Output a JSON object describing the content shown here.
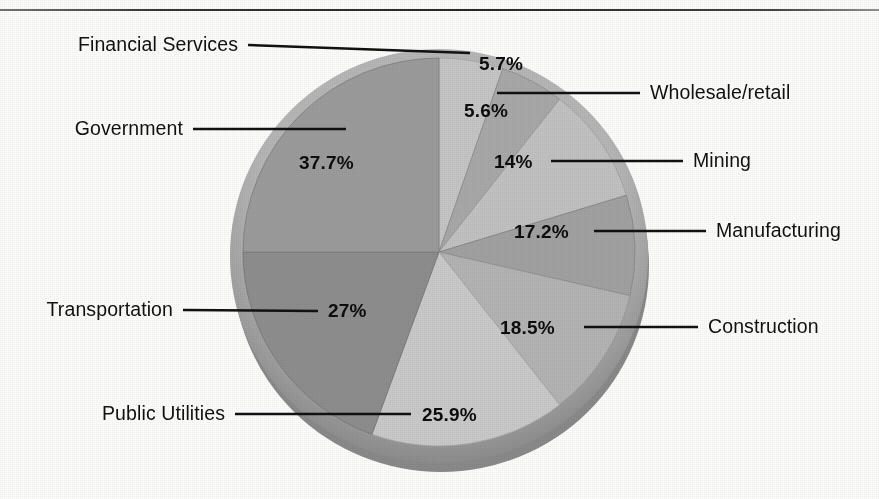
{
  "figure": {
    "type": "pie-chart-scan",
    "background_color": "#fdfdfc",
    "rule_color": "#232323"
  },
  "chart_data": {
    "type": "pie",
    "title": "",
    "subtitle": "",
    "xlabel": "",
    "ylabel": "",
    "legend_position": "callout-labels",
    "grid": false,
    "style": "3d-shaded-grayscale",
    "categories": [
      "Financial Services",
      "Wholesale/retail",
      "Mining",
      "Manufacturing",
      "Construction",
      "Public Utilities",
      "Transportation",
      "Government"
    ],
    "values": [
      5.7,
      5.6,
      14,
      17.2,
      18.5,
      25.9,
      27,
      37.7
    ],
    "value_labels": [
      "5.7%",
      "5.6%",
      "14%",
      "17.2%",
      "18.5%",
      "25.9%",
      "27%",
      "37.7%"
    ],
    "slices": [
      {
        "label": "Financial Services",
        "value_label": "5.7%",
        "value": 5.7,
        "color": "#c6c6c6",
        "side_color": "#a5a5a5",
        "start_angle": 0,
        "end_angle": 19,
        "label_side": "left"
      },
      {
        "label": "Wholesale/retail",
        "value_label": "5.6%",
        "value": 5.6,
        "color": "#a9a9a9",
        "side_color": "#8b8b8b",
        "start_angle": 19,
        "end_angle": 38,
        "label_side": "right"
      },
      {
        "label": "Mining",
        "value_label": "14%",
        "value": 14,
        "color": "#c2c2c2",
        "side_color": "#9e9e9e",
        "start_angle": 38,
        "end_angle": 73,
        "label_side": "right"
      },
      {
        "label": "Manufacturing",
        "value_label": "17.2%",
        "value": 17.2,
        "color": "#a2a2a2",
        "side_color": "#868686",
        "start_angle": 73,
        "end_angle": 103,
        "label_side": "right"
      },
      {
        "label": "Construction",
        "value_label": "18.5%",
        "value": 18.5,
        "color": "#b4b4b4",
        "side_color": "#949494",
        "start_angle": 103,
        "end_angle": 142,
        "label_side": "right"
      },
      {
        "label": "Public Utilities",
        "value_label": "25.9%",
        "value": 25.9,
        "color": "#cacaca",
        "side_color": "#a8a8a8",
        "start_angle": 142,
        "end_angle": 200,
        "label_side": "left"
      },
      {
        "label": "Transportation",
        "value_label": "27%",
        "value": 27,
        "color": "#8e8e8e",
        "side_color": "#767676",
        "start_angle": 200,
        "end_angle": 270,
        "label_side": "left"
      },
      {
        "label": "Government",
        "value_label": "37.7%",
        "value": 37.7,
        "color": "#9c9c9c",
        "side_color": "#7f7f7f",
        "start_angle": 270,
        "end_angle": 360,
        "label_side": "left"
      }
    ]
  },
  "callouts": {
    "financial_services": "Financial Services",
    "government": "Government",
    "transportation": "Transportation",
    "public_utilities": "Public Utilities",
    "wholesale_retail": "Wholesale/retail",
    "mining": "Mining",
    "manufacturing": "Manufacturing",
    "construction": "Construction"
  },
  "percent_labels": {
    "financial_services": "5.7%",
    "wholesale_retail": "5.6%",
    "mining": "14%",
    "manufacturing": "17.2%",
    "construction": "18.5%",
    "public_utilities": "25.9%",
    "transportation": "27%",
    "government": "37.7%"
  }
}
